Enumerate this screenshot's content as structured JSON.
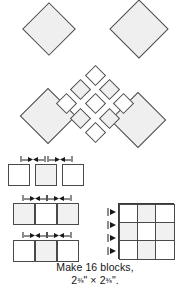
{
  "figure": {
    "kind": "quilting-block-assembly-diagram",
    "caption_line1": "Make 16 blocks,",
    "caption_line2": "2⅜\" × 2⅜\"",
    "caption_full": "Make 16 blocks, 2⅜\" × 2⅜\"",
    "block_count": 16,
    "finished_size": "2⅜\" × 2⅜\"",
    "width_measure": "2⅜\"",
    "height_measure": "2⅜\"",
    "multiplication_sign": "×"
  },
  "colors": {
    "outline": "#4a4a4a",
    "outline_strong": "#3a3a3a",
    "shaded_fill": "#f1f1f1",
    "light_fill": "#ffffff",
    "background": "#ffffff",
    "arrow": "#1a1a1a",
    "text": "#141414"
  },
  "medallion": {
    "label": "on-point block layout",
    "large_diamonds": [
      {
        "name": "large-diamond-top-left",
        "x": 30,
        "y": 10,
        "size": 38,
        "shaded": true
      },
      {
        "name": "large-diamond-top-right",
        "x": 118,
        "y": 8,
        "size": 42,
        "shaded": true
      },
      {
        "name": "large-diamond-bottom-left",
        "x": 28,
        "y": 96,
        "size": 40,
        "shaded": true
      },
      {
        "name": "large-diamond-bottom-right",
        "x": 118,
        "y": 100,
        "size": 40,
        "shaded": true
      }
    ],
    "small_diamond_grid": {
      "name": "center-nine-patch-on-point",
      "rows": 3,
      "cols": 3,
      "cell_size": 15,
      "pitch": 20,
      "origin_x": 95,
      "origin_y": 75,
      "shading": [
        [
          "light",
          "shaded",
          "light"
        ],
        [
          "shaded",
          "light",
          "shaded"
        ],
        [
          "light",
          "shaded",
          "light"
        ]
      ]
    }
  },
  "strips": {
    "label": "strip-set piecing steps",
    "rows": [
      {
        "name": "strip-row-1-cut-squares",
        "joined": false,
        "top": 6,
        "squares": [
          {
            "shaded": false,
            "left": 8
          },
          {
            "shaded": true,
            "left": 35
          },
          {
            "shaded": false,
            "left": 62
          }
        ],
        "arrows": [
          {
            "left": 20
          },
          {
            "left": 47
          }
        ]
      },
      {
        "name": "strip-row-2-dark-light-dark",
        "joined": true,
        "top": 45,
        "squares": [
          {
            "shaded": true,
            "left": 13
          },
          {
            "shaded": false,
            "left": 35
          },
          {
            "shaded": true,
            "left": 57
          }
        ],
        "arrows": [
          {
            "left": 22
          },
          {
            "left": 46
          }
        ]
      },
      {
        "name": "strip-row-3-light-dark-light",
        "joined": true,
        "top": 82,
        "squares": [
          {
            "shaded": false,
            "left": 13
          },
          {
            "shaded": true,
            "left": 35
          },
          {
            "shaded": false,
            "left": 57
          }
        ],
        "arrows": [
          {
            "left": 22
          },
          {
            "left": 46
          }
        ]
      }
    ]
  },
  "ninepatch": {
    "label": "assembled nine-patch block",
    "rows": 3,
    "cols": 3,
    "shading": [
      [
        "light",
        "shaded",
        "light"
      ],
      [
        "shaded",
        "light",
        "shaded"
      ],
      [
        "light",
        "shaded",
        "light"
      ]
    ],
    "seam_arrow_count": 4
  }
}
